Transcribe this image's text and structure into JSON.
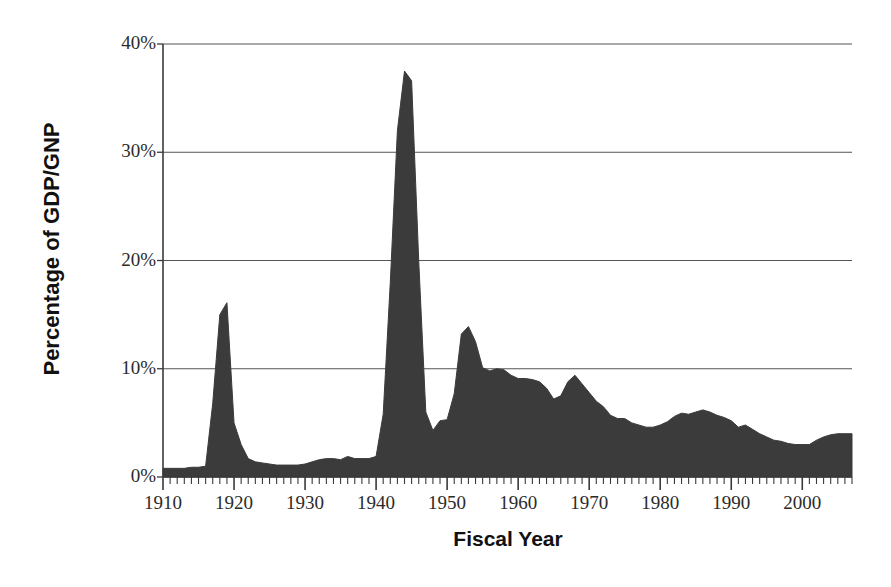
{
  "chart_data": {
    "type": "area",
    "title": "",
    "xlabel": "Fiscal Year",
    "ylabel": "Percentage of GDP/GNP",
    "xlim": [
      1910,
      2007
    ],
    "ylim": [
      0,
      40
    ],
    "grid": true,
    "legend": false,
    "x_tick_labels": [
      "1910",
      "1920",
      "1930",
      "1940",
      "1950",
      "1960",
      "1970",
      "1980",
      "1990",
      "2000"
    ],
    "x_tick_values": [
      1910,
      1920,
      1930,
      1940,
      1950,
      1960,
      1970,
      1980,
      1990,
      2000
    ],
    "x_minor_tick_interval": 1,
    "y_tick_labels": [
      "0%",
      "10%",
      "20%",
      "30%",
      "40%"
    ],
    "y_tick_values": [
      0,
      10,
      20,
      30,
      40
    ],
    "series_name": "Defense spending as percentage of GDP/GNP",
    "fill_color": "#3b3b3b",
    "axis_color": "#555555",
    "x": [
      1910,
      1911,
      1912,
      1913,
      1914,
      1915,
      1916,
      1917,
      1918,
      1919,
      1920,
      1921,
      1922,
      1923,
      1924,
      1925,
      1926,
      1927,
      1928,
      1929,
      1930,
      1931,
      1932,
      1933,
      1934,
      1935,
      1936,
      1937,
      1938,
      1939,
      1940,
      1941,
      1942,
      1943,
      1944,
      1945,
      1946,
      1947,
      1948,
      1949,
      1950,
      1951,
      1952,
      1953,
      1954,
      1955,
      1956,
      1957,
      1958,
      1959,
      1960,
      1961,
      1962,
      1963,
      1964,
      1965,
      1966,
      1967,
      1968,
      1969,
      1970,
      1971,
      1972,
      1973,
      1974,
      1975,
      1976,
      1977,
      1978,
      1979,
      1980,
      1981,
      1982,
      1983,
      1984,
      1985,
      1986,
      1987,
      1988,
      1989,
      1990,
      1991,
      1992,
      1993,
      1994,
      1995,
      1996,
      1997,
      1998,
      1999,
      2000,
      2001,
      2002,
      2003,
      2004,
      2005,
      2006,
      2007
    ],
    "y": [
      0.8,
      0.8,
      0.8,
      0.8,
      0.9,
      0.9,
      1.0,
      6.8,
      15.0,
      16.1,
      5.0,
      3.0,
      1.7,
      1.4,
      1.3,
      1.2,
      1.1,
      1.1,
      1.1,
      1.1,
      1.2,
      1.4,
      1.6,
      1.7,
      1.7,
      1.6,
      1.9,
      1.7,
      1.7,
      1.7,
      1.9,
      5.8,
      18.0,
      32.0,
      37.5,
      36.6,
      20.0,
      6.0,
      4.3,
      5.2,
      5.3,
      7.7,
      13.2,
      13.9,
      12.5,
      10.1,
      9.8,
      10.0,
      9.9,
      9.4,
      9.1,
      9.1,
      9.0,
      8.8,
      8.2,
      7.2,
      7.5,
      8.8,
      9.4,
      8.6,
      7.8,
      7.0,
      6.5,
      5.7,
      5.4,
      5.4,
      5.0,
      4.8,
      4.6,
      4.6,
      4.8,
      5.1,
      5.6,
      5.9,
      5.8,
      6.0,
      6.2,
      6.0,
      5.7,
      5.5,
      5.2,
      4.6,
      4.8,
      4.4,
      4.0,
      3.7,
      3.4,
      3.3,
      3.1,
      3.0,
      3.0,
      3.0,
      3.4,
      3.7,
      3.9,
      4.0,
      4.0,
      4.0
    ]
  }
}
